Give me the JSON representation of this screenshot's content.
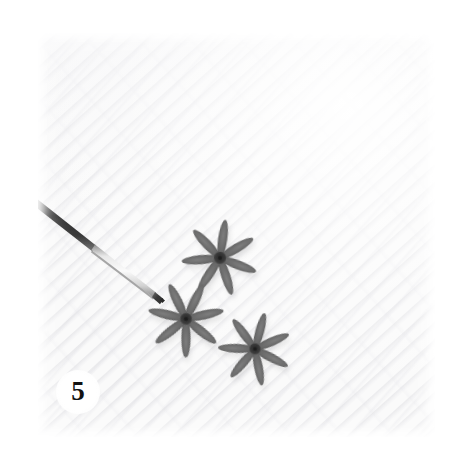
{
  "figure": {
    "panel_label": "5",
    "caption_present": false,
    "background_color": "#ffffff",
    "plate": {
      "surface_color": "#fafafa",
      "surface_description": "white woven cloth with fine diagonal weave texture",
      "left": 38,
      "top": 33,
      "width": 397,
      "height": 404
    },
    "subjects": [
      {
        "name": "star-flower-top",
        "kind": "dried star-shaped floral specimen",
        "center_x": 220,
        "center_y": 258,
        "diameter": 62,
        "petals": 7,
        "rotation_deg": 8,
        "color": "#6e6e6e",
        "center_color": "#3c3c3c"
      },
      {
        "name": "star-flower-left",
        "kind": "dried star-shaped floral specimen",
        "center_x": 186,
        "center_y": 319,
        "diameter": 60,
        "petals": 7,
        "rotation_deg": 26,
        "color": "#6a6a6a",
        "center_color": "#3a3a3a"
      },
      {
        "name": "star-flower-right",
        "kind": "dried star-shaped floral specimen",
        "center_x": 255,
        "center_y": 349,
        "diameter": 58,
        "petals": 7,
        "rotation_deg": 15,
        "color": "#6c6c6c",
        "center_color": "#3b3b3b"
      }
    ],
    "instrument": {
      "name": "dissecting-probe",
      "kind": "fine-tipped metal probe / forceps",
      "from_x": 38,
      "from_y": 201,
      "to_x": 161,
      "to_y": 299,
      "shaft_color": "#cfcfcf",
      "tip_color": "#3e3e3e",
      "handle_color": "#4a4a4a"
    }
  },
  "colors": {
    "page": "#ffffff",
    "plate": "#fafafa",
    "specimen": "#6a6a6a",
    "specimen_core": "#3a3a3a",
    "probe_tip": "#3e3e3e",
    "label_text": "#121212"
  }
}
